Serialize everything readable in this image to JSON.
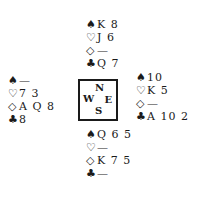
{
  "symbols": {
    "spade": "♠",
    "heart": "♡",
    "diamond": "◇",
    "club": "♣"
  },
  "compass": {
    "north": "N",
    "west": "W",
    "east": "E",
    "south": "S"
  },
  "hands": {
    "north": {
      "spades": "K 8",
      "hearts": "J 6",
      "diamonds": "—",
      "clubs": "Q 7"
    },
    "west": {
      "spades": "—",
      "hearts": "7 3",
      "diamonds": "A Q 8",
      "clubs": "8"
    },
    "east": {
      "spades": "10",
      "hearts": "K 5",
      "diamonds": "—",
      "clubs": "A 10 2"
    },
    "south": {
      "spades": "Q 6 5",
      "hearts": "—",
      "diamonds": "K 7 5",
      "clubs": "—"
    }
  }
}
